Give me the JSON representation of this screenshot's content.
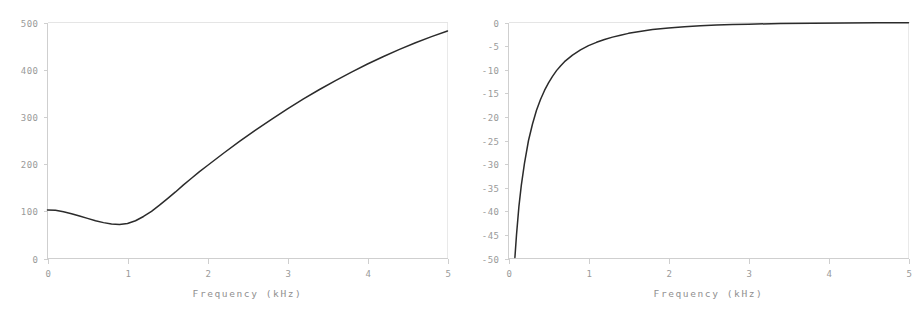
{
  "figure": {
    "name": "two-panel-frequency-response-figure",
    "background_color": "#ffffff",
    "curve_color": "#2b2b2b",
    "axis_color": "#cfcfcf",
    "label_color": "#9a9a9a"
  },
  "chart_data": [
    {
      "id": "left-panel",
      "type": "line",
      "title": "",
      "xlabel": "Frequency (kHz)",
      "ylabel": "",
      "xlim": [
        0,
        5
      ],
      "ylim": [
        0,
        500
      ],
      "xticks": [
        0,
        1,
        2,
        3,
        4,
        5
      ],
      "xticklabels": [
        "0",
        "1",
        "2",
        "3",
        "4",
        "5"
      ],
      "yticks": [
        0,
        100,
        200,
        300,
        400,
        500
      ],
      "yticklabels": [
        "0",
        "100",
        "200",
        "300",
        "400",
        "500"
      ],
      "grid": false,
      "legend": null,
      "series": [
        {
          "name": "response",
          "x": [
            0.0,
            0.1,
            0.2,
            0.3,
            0.4,
            0.5,
            0.6,
            0.7,
            0.8,
            0.9,
            1.0,
            1.1,
            1.2,
            1.3,
            1.4,
            1.5,
            1.6,
            1.7,
            1.8,
            1.9,
            2.0,
            2.2,
            2.4,
            2.6,
            2.8,
            3.0,
            3.2,
            3.4,
            3.6,
            3.8,
            4.0,
            4.2,
            4.4,
            4.6,
            4.8,
            5.0
          ],
          "y": [
            103,
            102,
            99,
            95,
            90,
            85,
            80,
            76,
            73,
            72,
            74,
            80,
            89,
            100,
            113,
            127,
            141,
            156,
            170,
            184,
            197,
            223,
            248,
            272,
            295,
            317,
            338,
            358,
            377,
            395,
            412,
            428,
            443,
            457,
            470,
            482
          ]
        }
      ]
    },
    {
      "id": "right-panel",
      "type": "line",
      "title": "",
      "xlabel": "Frequency (kHz)",
      "ylabel": "",
      "xlim": [
        0,
        5
      ],
      "ylim": [
        -50,
        0
      ],
      "xticks": [
        0,
        1,
        2,
        3,
        4,
        5
      ],
      "xticklabels": [
        "0",
        "1",
        "2",
        "3",
        "4",
        "5"
      ],
      "yticks": [
        0,
        -5,
        -10,
        -15,
        -20,
        -25,
        -30,
        -35,
        -40,
        -45,
        -50
      ],
      "yticklabels": [
        "0",
        "-5",
        "-10",
        "-15",
        "-20",
        "-25",
        "-30",
        "-35",
        "-40",
        "-45",
        "-50"
      ],
      "grid": false,
      "legend": null,
      "series": [
        {
          "name": "response",
          "x": [
            0.08,
            0.1,
            0.13,
            0.16,
            0.2,
            0.25,
            0.3,
            0.35,
            0.4,
            0.45,
            0.5,
            0.55,
            0.6,
            0.65,
            0.7,
            0.8,
            0.9,
            1.0,
            1.1,
            1.2,
            1.3,
            1.4,
            1.5,
            1.6,
            1.7,
            1.8,
            1.9,
            2.0,
            2.2,
            2.4,
            2.6,
            2.8,
            3.0,
            3.4,
            3.8,
            4.2,
            4.6,
            5.0
          ],
          "y": [
            -49.8,
            -45.0,
            -39.0,
            -34.5,
            -29.8,
            -25.0,
            -21.5,
            -18.6,
            -16.3,
            -14.4,
            -12.8,
            -11.4,
            -10.2,
            -9.2,
            -8.3,
            -6.9,
            -5.8,
            -4.9,
            -4.2,
            -3.6,
            -3.1,
            -2.7,
            -2.3,
            -2.0,
            -1.75,
            -1.5,
            -1.3,
            -1.15,
            -0.9,
            -0.7,
            -0.55,
            -0.45,
            -0.35,
            -0.22,
            -0.15,
            -0.1,
            -0.06,
            -0.04
          ]
        }
      ]
    }
  ]
}
